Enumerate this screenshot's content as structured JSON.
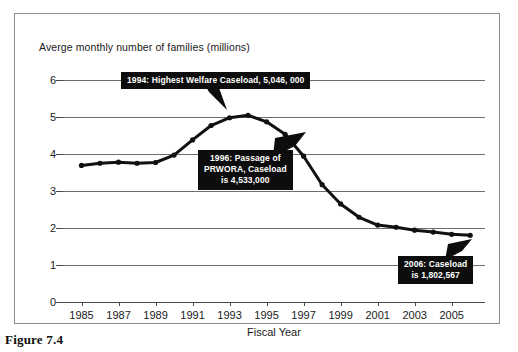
{
  "figure": {
    "caption": "Figure 7.4"
  },
  "chart_data": {
    "type": "line",
    "title": "",
    "xlabel": "Fiscal Year",
    "ylabel": "Averge monthly number of families (millions)",
    "ylim": [
      0,
      6
    ],
    "xlim": [
      1984,
      2006.8
    ],
    "grid": true,
    "legend": "none",
    "ytick_labels": [
      "0",
      "1",
      "2",
      "3",
      "4",
      "5",
      "6"
    ],
    "ytick_values": [
      0,
      1,
      2,
      3,
      4,
      5,
      6
    ],
    "xtick_labels": [
      "1985",
      "1987",
      "1989",
      "1991",
      "1993",
      "1995",
      "1997",
      "1999",
      "2001",
      "2003",
      "2005"
    ],
    "xtick_values": [
      1985,
      1987,
      1989,
      1991,
      1993,
      1995,
      1997,
      1999,
      2001,
      2003,
      2005
    ],
    "x": [
      1985,
      1986,
      1987,
      1988,
      1989,
      1990,
      1991,
      1992,
      1993,
      1994,
      1995,
      1996,
      1997,
      1998,
      1999,
      2000,
      2001,
      2002,
      2003,
      2004,
      2005,
      2006
    ],
    "values": [
      3.69,
      3.75,
      3.78,
      3.75,
      3.77,
      3.97,
      4.38,
      4.77,
      4.98,
      5.046,
      4.87,
      4.533,
      3.94,
      3.17,
      2.65,
      2.29,
      2.08,
      2.02,
      1.94,
      1.89,
      1.83,
      1.803
    ],
    "series": [
      {
        "name": "Average monthly number of families (millions)",
        "values": [
          3.69,
          3.75,
          3.78,
          3.75,
          3.77,
          3.97,
          4.38,
          4.77,
          4.98,
          5.046,
          4.87,
          4.533,
          3.94,
          3.17,
          2.65,
          2.29,
          2.08,
          2.02,
          1.94,
          1.89,
          1.83,
          1.803
        ]
      }
    ],
    "annotations": [
      {
        "id": "peak-1994",
        "lines": [
          "1994: Highest Welfare Caseload, 5,046, 000"
        ],
        "x": 1994,
        "y": 5.046
      },
      {
        "id": "prwora-1996",
        "lines": [
          "1996: Passage of",
          "PRWORA,  Caseload",
          "is 4,533,000"
        ],
        "x": 1996,
        "y": 4.533
      },
      {
        "id": "caseload-2006",
        "lines": [
          "2006: Caseload",
          "is 1,802,567"
        ],
        "x": 2006,
        "y": 1.803
      }
    ],
    "colors": {
      "line": "#111111",
      "marker": "#111111",
      "grid": "#6e6e6e",
      "annotation_background": "#0d0d0d",
      "annotation_text": "#ffffff",
      "frame": "#8c8c8c",
      "background": "#ffffff"
    }
  }
}
